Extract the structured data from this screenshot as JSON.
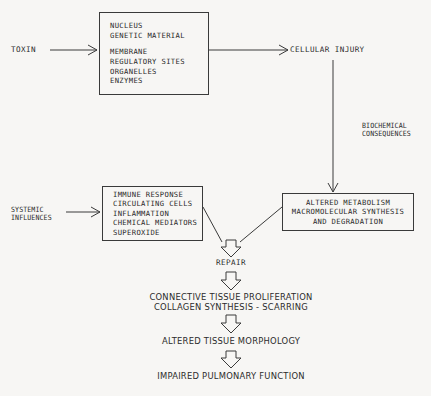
{
  "diagram": {
    "background_color": "#f7f6f4",
    "line_color": "#3a3a3a",
    "text_color": "#2b2b2b",
    "inputs": {
      "toxin": "TOXIN",
      "systemic_influences_line1": "SYSTEMIC",
      "systemic_influences_line2": "INFLUENCES"
    },
    "boxes": {
      "cell_targets": {
        "name": "cellular-targets-box",
        "lines": [
          "NUCLEUS",
          "GENETIC MATERIAL",
          "",
          "MEMBRANE",
          "REGULATORY SITES",
          "ORGANELLES",
          "ENZYMES"
        ]
      },
      "immune": {
        "name": "immune-response-box",
        "lines": [
          "IMMUNE RESPONSE",
          "CIRCULATING CELLS",
          "INFLAMMATION",
          "CHEMICAL MEDIATORS",
          "SUPEROXIDE"
        ]
      },
      "metabolism": {
        "name": "altered-metabolism-box",
        "lines": [
          "ALTERED METABOLISM",
          "MACROMOLECULAR SYNTHESIS",
          "AND DEGRADATION"
        ]
      }
    },
    "nodes": {
      "cellular_injury": "CELLULAR INJURY",
      "biochemical_consequences_line1": "BIOCHEMICAL",
      "biochemical_consequences_line2": "CONSEQUENCES",
      "repair": "REPAIR",
      "connective_tissue": "CONNECTIVE TISSUE PROLIFERATION",
      "collagen_synthesis": "COLLAGEN SYNTHESIS - SCARRING",
      "altered_tissue_morphology": "ALTERED TISSUE MORPHOLOGY",
      "impaired_pulmonary_function": "IMPAIRED PULMONARY FUNCTION"
    },
    "connectors": [
      {
        "name": "toxin-to-cell-targets-arrow",
        "style": "thin-open-arrow"
      },
      {
        "name": "cell-targets-to-cellular-injury-arrow",
        "style": "thin-open-arrow"
      },
      {
        "name": "cellular-injury-to-metabolism-arrow",
        "style": "thin-open-arrow"
      },
      {
        "name": "systemic-influences-to-immune-arrow",
        "style": "thin-open-arrow"
      },
      {
        "name": "immune-to-repair-merge",
        "style": "diagonal-merge"
      },
      {
        "name": "metabolism-to-repair-merge",
        "style": "diagonal-merge"
      },
      {
        "name": "merge-to-repair-hollow-arrow",
        "style": "hollow-block-arrow"
      },
      {
        "name": "repair-to-connective-tissue-hollow-arrow",
        "style": "hollow-block-arrow"
      },
      {
        "name": "connective-tissue-to-morphology-hollow-arrow",
        "style": "hollow-block-arrow"
      },
      {
        "name": "morphology-to-pulmonary-hollow-arrow",
        "style": "hollow-block-arrow"
      }
    ]
  }
}
